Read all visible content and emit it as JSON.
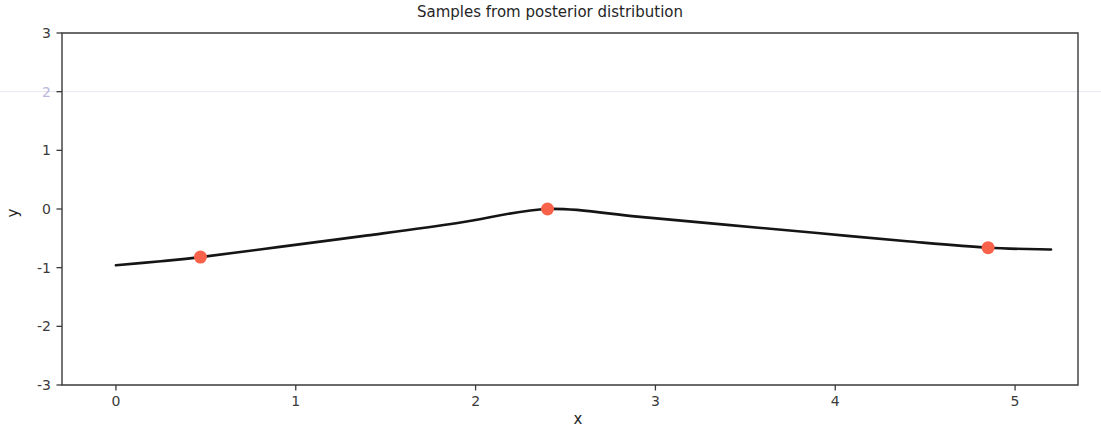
{
  "chart_data": {
    "type": "line",
    "title": "Samples from posterior distribution",
    "xlabel": "x",
    "ylabel": "y",
    "xlim": [
      -0.3,
      5.35
    ],
    "ylim": [
      -3,
      3
    ],
    "xticks": [
      0,
      1,
      2,
      3,
      4,
      5
    ],
    "xtick_labels": [
      "0",
      "1",
      "2",
      "3",
      "4",
      "5"
    ],
    "yticks": [
      3,
      2,
      1,
      0,
      -1,
      -2,
      -3
    ],
    "ytick_labels": [
      "3",
      "2",
      "1",
      "0",
      "-1",
      "-2",
      "-3"
    ],
    "ytick_faded": [
      "2"
    ],
    "grid": false,
    "faint_gridline_y": 2,
    "legend": null,
    "observations": {
      "name": "Observed data points",
      "color": "#f8624b",
      "marker": "circle",
      "x": [
        0.47,
        2.4,
        4.85
      ],
      "y": [
        -0.82,
        0.0,
        -0.66
      ]
    },
    "mean_series": {
      "name": "Posterior mean",
      "color": "#151515",
      "style": "solid",
      "x": [
        0.0,
        0.25,
        0.47,
        0.9,
        1.4,
        1.9,
        2.4,
        2.9,
        3.4,
        3.9,
        4.4,
        4.85,
        5.2
      ],
      "y": [
        -0.96,
        -0.89,
        -0.82,
        -0.65,
        -0.45,
        -0.24,
        0.0,
        -0.13,
        -0.27,
        -0.41,
        -0.55,
        -0.66,
        -0.69
      ]
    },
    "samples_meta": {
      "name": "Posterior samples",
      "count": 30,
      "style": "dashed",
      "alpha": 0.62,
      "palette": [
        "#8ec4e2",
        "#f09a7a",
        "#9fd49f",
        "#e8828a",
        "#b9a5d8",
        "#c4a48f",
        "#f0aed4",
        "#bfbfbf",
        "#dcdc8a",
        "#8fd8e0",
        "#7fb3d5",
        "#f5b375",
        "#86c98c",
        "#e06b74",
        "#a894cf",
        "#c99a82",
        "#eb9fc7",
        "#a8a8a8",
        "#d4d46f",
        "#79cdd6",
        "#a6cee3",
        "#fdbf6f",
        "#b2df8a",
        "#fb9a99",
        "#cab2d6",
        "#d9a27e",
        "#f7c0dd",
        "#cccccc",
        "#e3e37c",
        "#9fe0e6"
      ]
    },
    "series": [
      {
        "name": "sample-1",
        "color": "#8ec4e2",
        "y_at": {
          "0.0": 1.13,
          "0.47": -0.82,
          "1.2": 0.12,
          "1.85": 1.32,
          "2.4": 0.0,
          "3.1": -0.75,
          "3.7": 0.58,
          "4.3": 0.22,
          "4.85": -0.66,
          "5.2": -0.35
        }
      },
      {
        "name": "sample-2",
        "color": "#f09a7a",
        "y_at": {
          "0.0": 0.62,
          "0.47": -0.82,
          "1.1": 0.62,
          "1.6": 0.2,
          "2.4": 0.0,
          "3.0": -1.82,
          "3.6": -0.9,
          "4.2": 0.35,
          "4.85": -0.66,
          "5.2": -0.9
        }
      },
      {
        "name": "sample-3",
        "color": "#9fd49f",
        "y_at": {
          "0.0": -0.18,
          "0.47": -0.82,
          "1.0": -0.3,
          "1.7": 0.55,
          "2.4": 0.0,
          "3.2": 0.55,
          "3.9": 1.08,
          "4.4": 0.35,
          "4.85": -0.66,
          "5.2": -1.05
        }
      },
      {
        "name": "sample-4",
        "color": "#e8828a",
        "y_at": {
          "0.0": -1.42,
          "0.47": -0.82,
          "1.35": 1.2,
          "1.9": 0.45,
          "2.4": 0.0,
          "2.9": 0.9,
          "3.55": 1.22,
          "4.2": 0.72,
          "4.85": -0.66,
          "5.2": -0.5
        }
      },
      {
        "name": "sample-5",
        "color": "#b9a5d8",
        "y_at": {
          "0.0": 0.05,
          "0.47": -0.82,
          "1.15": 0.35,
          "1.8": -0.4,
          "2.4": 0.0,
          "3.05": 0.5,
          "3.6": -0.25,
          "4.3": -1.0,
          "4.85": -0.66,
          "5.2": -0.15
        }
      },
      {
        "name": "sample-6",
        "color": "#c4a48f",
        "y_at": {
          "0.0": -0.55,
          "0.47": -0.82,
          "1.25": -0.55,
          "1.75": 0.3,
          "2.4": 0.0,
          "3.15": -0.45,
          "3.75": 0.92,
          "4.4": 0.05,
          "4.85": -0.66,
          "5.2": -1.2
        }
      },
      {
        "name": "sample-7",
        "color": "#f0aed4",
        "y_at": {
          "0.0": 0.35,
          "0.47": -0.82,
          "1.05": 0.2,
          "1.55": -0.75,
          "2.4": 0.0,
          "3.3": 0.85,
          "4.0": 1.25,
          "4.5": 0.5,
          "4.85": -0.66,
          "5.2": -0.78
        }
      },
      {
        "name": "sample-8",
        "color": "#bfbfbf",
        "y_at": {
          "0.0": -0.95,
          "0.47": -0.82,
          "1.3": 0.45,
          "1.95": 0.85,
          "2.4": 0.0,
          "2.95": -0.6,
          "3.65": 0.3,
          "4.25": -0.45,
          "4.85": -0.66,
          "5.2": -0.25
        }
      },
      {
        "name": "sample-9",
        "color": "#dcdc8a",
        "y_at": {
          "0.0": -0.75,
          "0.47": -0.82,
          "1.1": -0.95,
          "1.8": -0.2,
          "2.4": 0.0,
          "3.1": -1.35,
          "3.8": -1.25,
          "4.4": -0.3,
          "4.85": -0.66,
          "5.2": -1.35
        }
      },
      {
        "name": "sample-10",
        "color": "#8fd8e0",
        "y_at": {
          "0.0": 0.22,
          "0.47": -0.82,
          "1.2": 0.75,
          "1.7": 0.25,
          "2.4": 0.0,
          "3.25": 0.35,
          "3.85": 0.65,
          "4.45": -0.2,
          "4.85": -0.66,
          "5.2": -0.62
        }
      },
      {
        "name": "sample-11",
        "color": "#7fb3d5",
        "y_at": {
          "0.0": 0.88,
          "0.47": -0.82,
          "1.4": 0.9,
          "1.9": 0.35,
          "2.4": 0.0,
          "3.0": -0.3,
          "3.7": 0.45,
          "4.35": 0.85,
          "4.85": -0.66,
          "5.2": -0.05
        }
      },
      {
        "name": "sample-12",
        "color": "#f5b375",
        "y_at": {
          "0.0": -1.15,
          "0.47": -0.82,
          "0.95": -0.5,
          "1.6": 0.7,
          "2.4": 0.0,
          "3.0": -1.55,
          "3.55": -0.55,
          "4.2": 0.6,
          "4.85": -0.66,
          "5.2": -1.15
        }
      },
      {
        "name": "sample-13",
        "color": "#86c98c",
        "y_at": {
          "0.0": -0.32,
          "0.47": -0.82,
          "1.15": 0.05,
          "1.75": 0.95,
          "2.4": 0.0,
          "3.2": -0.85,
          "3.9": 0.15,
          "4.5": 0.4,
          "4.85": -0.66,
          "5.2": -0.85
        }
      },
      {
        "name": "sample-14",
        "color": "#e06b74",
        "y_at": {
          "0.0": -1.25,
          "0.47": -0.82,
          "1.45": 1.1,
          "2.0": 0.6,
          "2.4": 0.0,
          "2.95": 0.45,
          "3.6": 1.15,
          "4.3": 0.95,
          "4.85": -0.66,
          "5.2": -0.42
        }
      },
      {
        "name": "sample-15",
        "color": "#a894cf",
        "y_at": {
          "0.0": 0.12,
          "0.47": -0.82,
          "1.25": -0.2,
          "1.85": 0.15,
          "2.4": 0.0,
          "3.1": 0.7,
          "3.8": -0.35,
          "4.4": -0.85,
          "4.85": -0.66,
          "5.2": -0.2
        }
      },
      {
        "name": "sample-16",
        "color": "#c99a82",
        "y_at": {
          "0.0": -0.62,
          "0.47": -0.82,
          "1.05": -0.7,
          "1.65": 0.4,
          "2.4": 0.0,
          "3.35": 0.25,
          "3.95": 0.85,
          "4.45": 0.15,
          "4.85": -0.66,
          "5.2": -1.1
        }
      },
      {
        "name": "sample-17",
        "color": "#eb9fc7",
        "y_at": {
          "0.0": 0.45,
          "0.47": -0.82,
          "1.35": 0.55,
          "1.95": 1.15,
          "2.4": 0.0,
          "3.05": -0.95,
          "3.75": 0.75,
          "4.35": 1.05,
          "4.85": -0.66,
          "5.2": -0.55
        }
      },
      {
        "name": "sample-18",
        "color": "#a8a8a8",
        "y_at": {
          "0.0": -0.85,
          "0.47": -0.82,
          "1.2": 0.25,
          "1.8": -0.55,
          "2.4": 0.0,
          "3.15": -0.4,
          "3.85": 0.35,
          "4.25": -0.6,
          "4.85": -0.66,
          "5.2": -0.3
        }
      },
      {
        "name": "sample-19",
        "color": "#d4d46f",
        "y_at": {
          "0.0": -0.45,
          "0.47": -0.82,
          "1.1": -1.05,
          "1.7": -0.35,
          "2.4": 0.0,
          "3.2": -1.15,
          "3.9": -1.35,
          "4.5": -0.55,
          "4.85": -0.66,
          "5.2": -1.45
        }
      },
      {
        "name": "sample-20",
        "color": "#79cdd6",
        "y_at": {
          "0.0": 0.68,
          "0.47": -0.82,
          "1.3": 0.85,
          "1.9": 0.05,
          "2.4": 0.0,
          "3.0": 0.15,
          "3.7": 0.55,
          "4.4": -0.35,
          "4.85": -0.66,
          "5.2": -0.72
        }
      },
      {
        "name": "sample-21",
        "color": "#a6cee3",
        "y_at": {
          "0.0": 0.95,
          "0.47": -0.82,
          "1.5": 1.25,
          "2.05": 0.5,
          "2.4": 0.0,
          "2.9": -0.55,
          "3.65": 0.95,
          "4.3": 0.45,
          "4.85": -0.66,
          "5.2": 0.05
        }
      },
      {
        "name": "sample-22",
        "color": "#fdbf6f",
        "y_at": {
          "0.0": -1.05,
          "0.47": -0.82,
          "1.0": -0.85,
          "1.6": 0.25,
          "2.4": 0.0,
          "3.05": -1.65,
          "3.6": -0.75,
          "4.25": 0.25,
          "4.85": -0.66,
          "5.2": -1.25
        }
      },
      {
        "name": "sample-23",
        "color": "#b2df8a",
        "y_at": {
          "0.0": -0.25,
          "0.47": -0.82,
          "1.2": 0.3,
          "1.85": 0.7,
          "2.4": 0.0,
          "3.25": 0.6,
          "3.95": 0.45,
          "4.45": -0.15,
          "4.85": -0.66,
          "5.2": -0.95
        }
      },
      {
        "name": "sample-24",
        "color": "#fb9a99",
        "y_at": {
          "0.0": -1.35,
          "0.47": -0.82,
          "1.4": 0.95,
          "1.95": 0.25,
          "2.4": 0.0,
          "2.95": 0.75,
          "3.5": 1.05,
          "4.15": 0.85,
          "4.85": -0.66,
          "5.2": -0.48
        }
      },
      {
        "name": "sample-25",
        "color": "#cab2d6",
        "y_at": {
          "0.0": 0.0,
          "0.47": -0.82,
          "1.15": -0.4,
          "1.75": 0.45,
          "2.4": 0.0,
          "3.1": 0.4,
          "3.8": -0.55,
          "4.35": -0.95,
          "4.85": -0.66,
          "5.2": -0.1
        }
      },
      {
        "name": "sample-26",
        "color": "#d9a27e",
        "y_at": {
          "0.0": -0.7,
          "0.47": -0.82,
          "1.05": -0.25,
          "1.7": 0.6,
          "2.4": 0.0,
          "3.3": -0.65,
          "3.85": 0.65,
          "4.4": 0.3,
          "4.85": -0.66,
          "5.2": -1.0
        }
      },
      {
        "name": "sample-27",
        "color": "#f7c0dd",
        "y_at": {
          "0.0": 0.5,
          "0.47": -0.82,
          "1.25": 0.65,
          "1.8": -0.15,
          "2.4": 0.0,
          "3.0": 0.25,
          "3.75": 1.0,
          "4.5": 0.6,
          "4.85": -0.66,
          "5.2": -0.68
        }
      },
      {
        "name": "sample-28",
        "color": "#cccccc",
        "y_at": {
          "0.0": -0.9,
          "0.47": -0.82,
          "1.35": 0.5,
          "1.9": -0.45,
          "2.4": 0.0,
          "3.15": -0.25,
          "3.7": 0.2,
          "4.2": -0.5,
          "4.85": -0.66,
          "5.2": -0.38
        }
      },
      {
        "name": "sample-29",
        "color": "#e3e37c",
        "y_at": {
          "0.0": -0.5,
          "0.47": -0.82,
          "1.1": -0.75,
          "1.65": -0.1,
          "2.4": 0.0,
          "3.2": -1.05,
          "3.9": -0.95,
          "4.45": -0.4,
          "4.85": -0.66,
          "5.2": -1.3
        }
      },
      {
        "name": "sample-30",
        "color": "#9fe0e6",
        "y_at": {
          "0.0": 0.3,
          "0.47": -0.82,
          "1.2": 0.45,
          "1.85": 0.9,
          "2.4": 0.0,
          "3.05": -0.5,
          "3.8": 0.8,
          "4.3": -0.1,
          "4.85": -0.66,
          "5.2": -0.58
        }
      }
    ]
  }
}
